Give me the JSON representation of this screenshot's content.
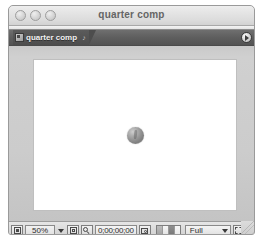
{
  "window": {
    "title": "quarter comp",
    "controls": [
      {
        "name": "close-button",
        "label": "Close"
      },
      {
        "name": "minimize-button",
        "label": "Minimize"
      },
      {
        "name": "zoom-button",
        "label": "Zoom"
      }
    ]
  },
  "tabbar": {
    "tab_label": "quarter comp",
    "tab_icon": "composition-icon",
    "pin_glyph": "♪",
    "menu_button_icon": "panel-menu-icon"
  },
  "viewer": {
    "canvas_background": "#ffffff",
    "background": "#cccccc",
    "object_name": "quarter-coin",
    "object_color": "#959595"
  },
  "toolbar": {
    "always_preview_icon": "always-preview-this-view-icon",
    "zoom_value": "50%",
    "zoom_caret_icon": "chevron-down-icon",
    "roi_icon": "region-of-interest-icon",
    "grid_guides_icon": "grid-and-guides-icon",
    "timecode": "0;00;00;00",
    "snapshot_icon": "take-snapshot-icon",
    "channel_swatches": [
      "rgb",
      "red",
      "green",
      "alpha"
    ],
    "resolution_label": "Full",
    "resolution_caret_icon": "chevron-down-icon",
    "region-of-interest_icon": "region-of-interest-frame-icon",
    "transparency_grid_icon": "transparency-grid-icon",
    "resize_handle_icon": "resize-grip-icon"
  }
}
